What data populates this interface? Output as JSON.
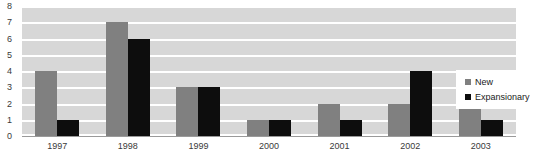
{
  "chart_data": {
    "type": "bar",
    "title": "",
    "xlabel": "",
    "ylabel": "",
    "categories": [
      "1997",
      "1998",
      "1999",
      "2000",
      "2001",
      "2002",
      "2003"
    ],
    "series": [
      {
        "name": "New",
        "color": "#808080",
        "values": [
          4,
          7,
          3,
          1,
          2,
          2,
          2
        ]
      },
      {
        "name": "Expansionary",
        "color": "#0d0d0d",
        "values": [
          1,
          6,
          3,
          1,
          1,
          4,
          1
        ]
      }
    ],
    "ylim": [
      0,
      8
    ],
    "ytick_labels": [
      "0",
      "1",
      "2",
      "3",
      "4",
      "5",
      "6",
      "7",
      "8"
    ],
    "ytick_step": 1,
    "grid": true,
    "grid_color": "#ffffff",
    "plot_background": "#d7d7d7",
    "legend_position": "right"
  },
  "legend": {
    "items": [
      {
        "label": "New",
        "swatch": "legend-swatch-new"
      },
      {
        "label": "Expansionary",
        "swatch": "legend-swatch-expansionary"
      }
    ]
  },
  "title_remnant": ""
}
